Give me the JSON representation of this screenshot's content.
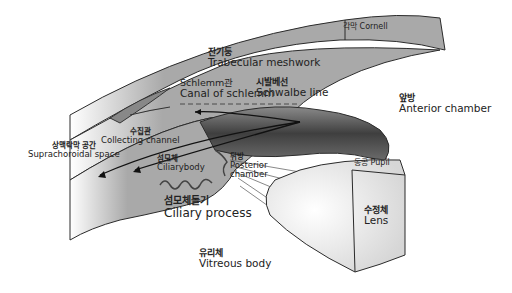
{
  "diagram": {
    "colors": {
      "tissue": "#a9a9a9",
      "tissue_dark": "#6e6e6e",
      "iris_dark": "#4a4a4a",
      "lens": "#f2f2f2",
      "outline": "#2b2b2b",
      "background": "#ffffff"
    },
    "labels": {
      "cornea": {
        "ko": "각막",
        "en": "Cornell"
      },
      "trabecular": {
        "ko": "잔기둥",
        "en": "Trabecular meshwork"
      },
      "schlemm": {
        "ko": "Schlemm관",
        "en": "Canal of schlemm"
      },
      "schwalbe": {
        "ko": "시발베선",
        "en": "Schwalbe line"
      },
      "anterior_chamber": {
        "ko": "앞방",
        "en": "Anterior chamber"
      },
      "collecting": {
        "ko": "수집관",
        "en": "Collecting channel"
      },
      "suprachoroidal": {
        "ko": "상맥락막 공간",
        "en": "Suprachoroidal space"
      },
      "ciliary_body": {
        "ko": "섬모체",
        "en": "Ciliarybody"
      },
      "posterior_chamber": {
        "ko": "뒤방",
        "en1": "Posterior",
        "en2": "chamber"
      },
      "pupil": {
        "ko": "동공",
        "en": "Pupil"
      },
      "ciliary_process": {
        "ko": "섬모체돌기",
        "en": "Ciliary process"
      },
      "lens": {
        "ko": "수정체",
        "en": "Lens"
      },
      "vitreous": {
        "ko": "유리체",
        "en": "Vitreous body"
      }
    }
  }
}
